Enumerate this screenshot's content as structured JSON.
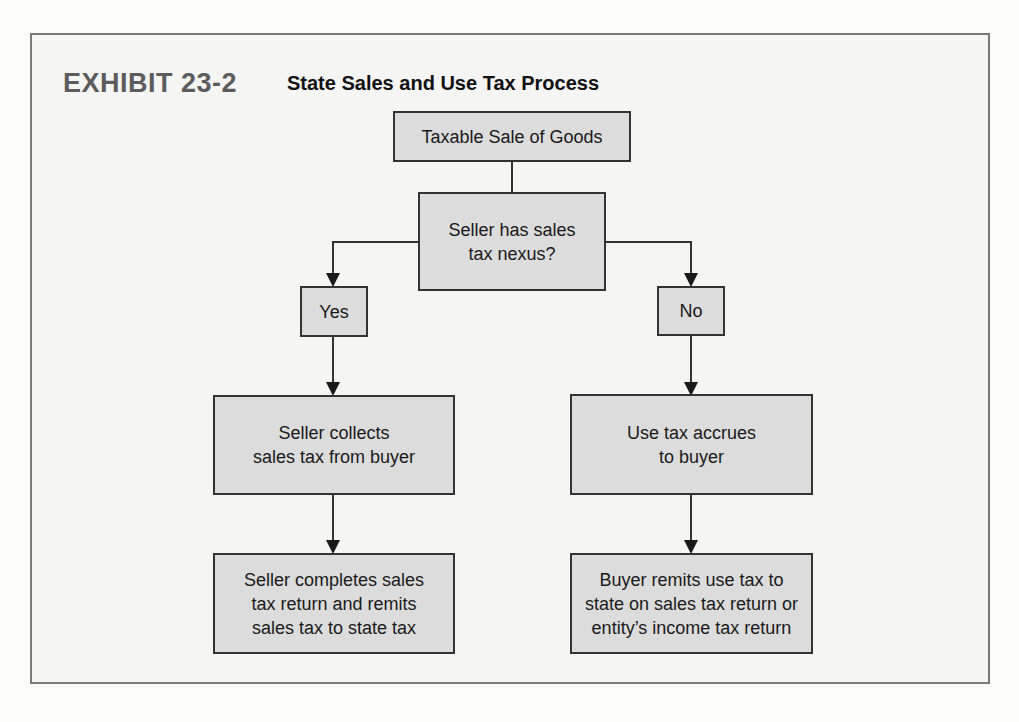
{
  "exhibit": {
    "label": "EXHIBIT 23-2",
    "title": "State Sales and Use Tax Process"
  },
  "flowchart": {
    "start": {
      "text": "Taxable Sale of Goods"
    },
    "decision": {
      "line1": "Seller has sales",
      "line2": "tax nexus?"
    },
    "yes_branch": {
      "label": "Yes",
      "step1": {
        "line1": "Seller collects",
        "line2": "sales tax from buyer"
      },
      "step2": {
        "line1": "Seller completes sales",
        "line2": "tax return and remits",
        "line3": "sales tax to state tax"
      }
    },
    "no_branch": {
      "label": "No",
      "step1": {
        "line1": "Use tax accrues",
        "line2": "to buyer"
      },
      "step2": {
        "line1": "Buyer remits use tax to",
        "line2": "state on sales tax return or",
        "line3": "entity’s income tax return"
      }
    }
  },
  "colors": {
    "box_fill": "#dcdcdc",
    "box_border": "#333333",
    "frame_border": "#7a7a7a",
    "exhibit_label": "#5c5c5c"
  }
}
